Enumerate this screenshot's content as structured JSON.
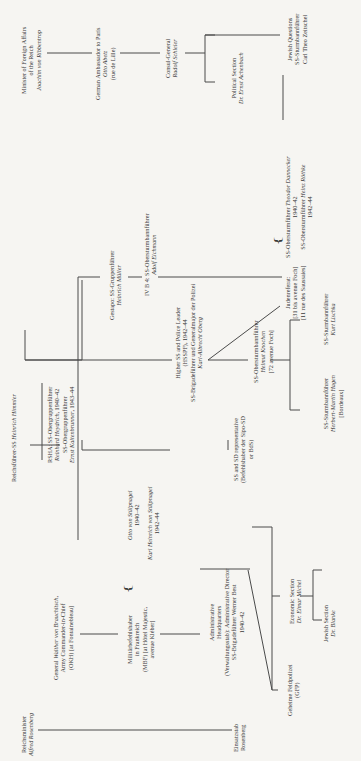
{
  "chart": {
    "orientation": "rotated-90-ccw",
    "nodes": {
      "ribbentrop": {
        "lines": [
          "Minister of Foreign Affairs",
          "of the Reich"
        ],
        "name": "Joachim von Ribbentrop"
      },
      "abetz": {
        "lines": [
          "German Ambassador to Paris"
        ],
        "name": "Otto Abetz",
        "extra": "(rue de Lille)"
      },
      "schleier": {
        "lines": [
          "Consul-General"
        ],
        "name": "Rudolf Schleier"
      },
      "zeitschel": {
        "lines": [
          "Jewish Questions",
          "SS-Sturmbannführer"
        ],
        "name": "Carl Theo Zeitschel"
      },
      "achenbach": {
        "lines": [
          "Political Section"
        ],
        "name": "Dr. Ernst Achenbach"
      },
      "dannecker": {
        "line1_prefix": "SS-Obersturmführer ",
        "name": "Theodor Dannecker",
        "years": "1940–42"
      },
      "rothke": {
        "line1_prefix": "SS-Obersturmführer ",
        "name": "Heinz Röthke",
        "years": "1942–44"
      },
      "mueller": {
        "lines": [
          "Gestapo: SS-Gruppenführer"
        ],
        "name": "Heinrich Müller"
      },
      "eichmann": {
        "lines": [
          "IV B 4: SS-Obersturmbannführer"
        ],
        "name": "Adolf Eichmann"
      },
      "judenreferat": {
        "lines": [
          "Judenreferat:",
          "[31 bis avenue Foch]",
          "[11 rue des Saussaies]"
        ]
      },
      "himmler": {
        "prefix": "Reichsführer-SS ",
        "name": "Heinrich Himmler"
      },
      "rsha": {
        "line1_prefix": "RSHA: SS-Obergruppenführer",
        "heydrich": "Reinhard Heydrich",
        "heydrich_years": ", 1940–42",
        "line3": "SS-Obergruppenführer",
        "kaltenbrunner": "Ernst Kaltenbrunner",
        "kaltenbrunner_years": ", 1943–44"
      },
      "hsspf": {
        "lines": [
          "Higher SS and Police Leader",
          "(HSSPF), 1942–44",
          "SS-Brigadeführer und Generalmajor der Polizei"
        ],
        "name": "Karl-Albrecht Oberg"
      },
      "knochen": {
        "lines": [
          "SS-Obersturmbannführer"
        ],
        "name": "Helmut Knochen",
        "extra": "[72 avenue Foch]"
      },
      "lischka": {
        "lines": [
          "SS-Sturmbannführer"
        ],
        "name": "Kurt Lischka"
      },
      "hagen": {
        "lines": [
          "SS-Sturmbannführer"
        ],
        "name": "Herbert-Martin Hagen",
        "extra": "[Bordeaux]"
      },
      "sssd": {
        "lines": [
          "SS and SD representative",
          "(Befehlshaber der Sipo-SD",
          "or BdS)"
        ]
      },
      "stuelpnagel_o": {
        "name": "Otto von Stülpnagel",
        "years": "1940–42"
      },
      "stuelpnagel_k": {
        "name": "Karl Heinrich von Stülpnagel",
        "years": "1942–44"
      },
      "brauchitsch": {
        "prefix": "General ",
        "name": "Walther von Brauchitsch",
        "suffix": ",",
        "lines": [
          "Army Commander-in-Chief",
          "(OKH) [at Fontainebleau]"
        ]
      },
      "mbf": {
        "lines": [
          "Militärbefehlshaber",
          "in Frankreich",
          "(MBF) [at Hôtel Majestic,",
          "avenue Kléber]"
        ]
      },
      "admin": {
        "lines": [
          "Administrative",
          "Headquarters",
          "(Verwaltungsstab): Administrative Director",
          "SS-Brigadeführer Werner Best",
          "1940–42"
        ]
      },
      "economic": {
        "lines": [
          "Economic Section"
        ],
        "name": "Dr. Elmar Michel"
      },
      "jewish_section": {
        "lines": [
          "Jewish Section"
        ],
        "name": "Dr. Blanke"
      },
      "gfp": {
        "lines": [
          "Geheime Feldpolizei",
          "(GFP)"
        ]
      },
      "rosenberg": {
        "lines": [
          "Reichsminister"
        ],
        "name": "Alfred Rosenberg"
      },
      "einsatzstab": {
        "lines": [
          "Einsatzstab",
          "Rosenberg"
        ]
      }
    }
  }
}
